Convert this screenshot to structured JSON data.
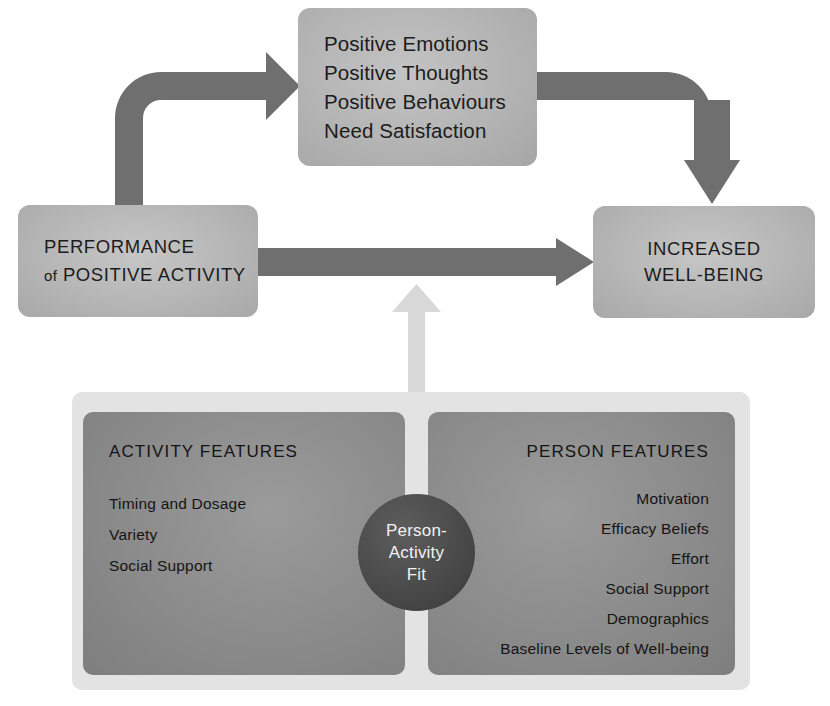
{
  "diagram": {
    "colors": {
      "background": "#ffffff",
      "box_fill": "#b6b6b6",
      "panel_outer": "#e3e3e3",
      "panel_inner": "#8d8d8d",
      "dark_arrow": "#6e6e6e",
      "light_arrow": "#d6d6d6",
      "circle_fill": "#4a4a4a",
      "text_dark": "#1c1c1c",
      "text_light": "#f2f2f2"
    },
    "nodes": {
      "positive_outcomes": {
        "lines": [
          "Positive Emotions",
          "Positive Thoughts",
          "Positive Behaviours",
          "Need Satisfaction"
        ]
      },
      "performance": {
        "line1": "PERFORMANCE",
        "line2_prefix": "of",
        "line2": "POSITIVE ACTIVITY"
      },
      "wellbeing": {
        "line1": "INCREASED",
        "line2": "WELL-BEING"
      },
      "fit_circle": {
        "lines": [
          "Person-",
          "Activity",
          "Fit"
        ]
      }
    },
    "panels": [
      {
        "id": "activity-features",
        "title": "ACTIVITY FEATURES",
        "align": "left",
        "items": [
          "Timing and Dosage",
          "Variety",
          "Social Support"
        ]
      },
      {
        "id": "person-features",
        "title": "PERSON FEATURES",
        "align": "right",
        "items": [
          "Motivation",
          "Efficacy Beliefs",
          "Effort",
          "Social Support",
          "Demographics",
          "Baseline Levels of Well-being"
        ]
      }
    ],
    "arrows": [
      {
        "id": "performance-to-outcomes",
        "from": "performance",
        "to": "positive_outcomes",
        "style": "curved-dark"
      },
      {
        "id": "outcomes-to-wellbeing",
        "from": "positive_outcomes",
        "to": "wellbeing",
        "style": "curved-dark"
      },
      {
        "id": "performance-to-wellbeing",
        "from": "performance",
        "to": "wellbeing",
        "style": "straight-dark"
      },
      {
        "id": "fit-to-path",
        "from": "fit_circle",
        "to": "performance-to-wellbeing",
        "style": "straight-light-up"
      }
    ]
  }
}
